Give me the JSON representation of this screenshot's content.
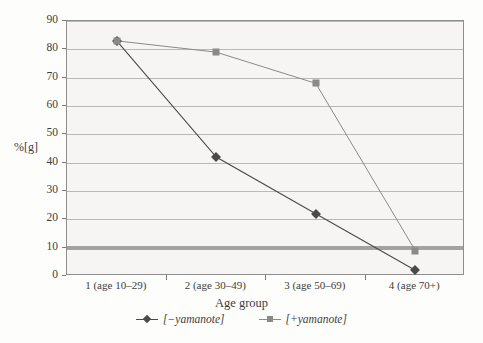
{
  "chart_data": {
    "type": "line",
    "title": "",
    "xlabel": "Age group",
    "ylabel": "%[g]",
    "categories": [
      "1 (age 10–29)",
      "2 (age 30–49)",
      "3 (age 50–69)",
      "4 (age 70+)"
    ],
    "ylim": [
      0,
      90
    ],
    "yticks": [
      0,
      10,
      20,
      30,
      40,
      50,
      60,
      70,
      80,
      90
    ],
    "grid": true,
    "legend_position": "bottom",
    "emphasis_gridline": 10,
    "series": [
      {
        "name": "[−yamanote]",
        "marker": "diamond",
        "color": "#4a4a4a",
        "values": [
          83,
          42,
          22,
          2
        ]
      },
      {
        "name": "[+yamanote]",
        "marker": "square",
        "color": "#8a8a8a",
        "values": [
          83,
          79,
          68,
          9
        ]
      }
    ]
  },
  "axis": {
    "y_label": "%[g]",
    "x_label": "Age group",
    "y_tick_labels": [
      "90",
      "80",
      "70",
      "60",
      "50",
      "40",
      "30",
      "20",
      "10",
      "0"
    ],
    "x_tick_labels": [
      "1 (age 10–29)",
      "2 (age 30–49)",
      "3 (age 50–69)",
      "4 (age 70+)"
    ]
  },
  "legend": {
    "items": [
      {
        "label": "[−yamanote]",
        "marker": "diamond-marker",
        "color": "#4a4a4a"
      },
      {
        "label": "[+yamanote]",
        "marker": "square-marker",
        "color": "#8a8a8a"
      }
    ]
  },
  "colors": {
    "plot_background": "#f6f5f3",
    "grid": "#b9b9b9",
    "axis": "#8e8e8e",
    "series_minus": "#4a4a4a",
    "series_plus": "#8a8a8a",
    "emphasis_band": "#a2a2a2"
  }
}
